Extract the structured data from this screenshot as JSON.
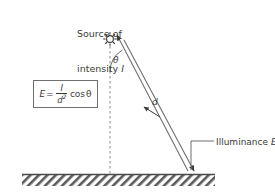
{
  "diagram": {
    "title_label": "Source of\nintensity I",
    "source_label_line1": "Source of",
    "source_label_line2_prefix": "intensity ",
    "source_label_line2_var": "I",
    "illuminance_prefix": "Illuminance ",
    "illuminance_var": "E",
    "theta_symbol": "θ",
    "distance_symbol": "d",
    "formula": {
      "lhs": "E",
      "equals": "=",
      "numerator": "I",
      "denominator_base": "d",
      "denominator_exp": "2",
      "trig": "cos ",
      "angle": "θ",
      "plain_text": "E = I/d² cos θ"
    },
    "icons": {
      "source": "sun-icon",
      "ground": "hatched-ground-icon",
      "ray": "light-ray-arrow-icon",
      "normal": "dashed-normal-line-icon",
      "distance": "double-headed-arrow-icon",
      "leader": "leader-line-icon"
    },
    "colors": {
      "stroke": "#6f6f6f",
      "text": "#3b3b3b",
      "ground_line": "#4a4a4a",
      "hatch": "#5a5a5a",
      "background": "#ffffff"
    }
  }
}
